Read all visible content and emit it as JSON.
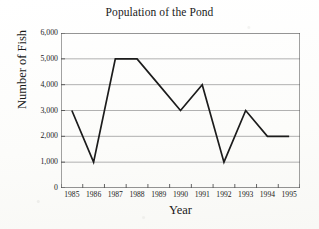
{
  "chart_data": {
    "type": "line",
    "title": "Population of the Pond",
    "xlabel": "Year",
    "ylabel": "Number of Fish",
    "categories": [
      "1985",
      "1986",
      "1987",
      "1988",
      "1989",
      "1990",
      "1991",
      "1992",
      "1993",
      "1994",
      "1995"
    ],
    "values": [
      3000,
      1000,
      5000,
      5000,
      4000,
      3000,
      4000,
      1000,
      3000,
      2000,
      2000
    ],
    "x": [
      1985,
      1986,
      1987,
      1988,
      1989,
      1990,
      1991,
      1992,
      1993,
      1994,
      1995
    ],
    "ylim": [
      0,
      6000
    ],
    "ytick_values": [
      0,
      1000,
      2000,
      3000,
      4000,
      5000,
      6000
    ],
    "ytick_labels": [
      "0",
      "1,000",
      "2,000",
      "3,000",
      "4,000",
      "5,000",
      "6,000"
    ],
    "grid": true,
    "grid_axis": "y",
    "legend": false,
    "legend_position": "none",
    "line_color": "#1c1c1c",
    "grid_color": "#a8a8a8",
    "axis_color": "#555555",
    "background_color": "#fdfdfc",
    "markers": false
  },
  "figure": {
    "title": "Population of the Pond",
    "x_axis_title": "Year",
    "y_axis_title": "Number of Fish"
  }
}
